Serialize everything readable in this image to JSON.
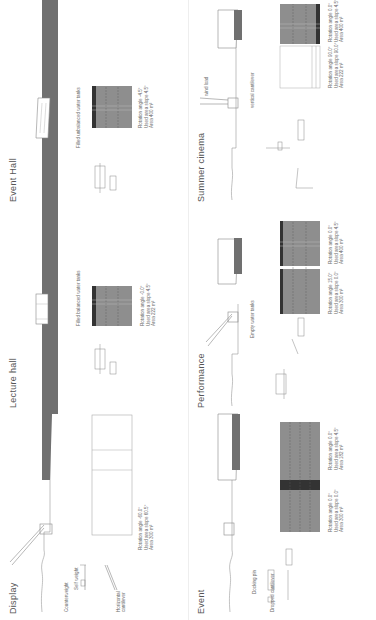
{
  "diagram": {
    "orientation": "rotated 90deg counter-clockwise",
    "colors": {
      "ground_dark": "#707070",
      "grid_fill": "#8e8e8e",
      "line": "#888888",
      "text": "#555555",
      "background": "#ffffff"
    },
    "panels": [
      {
        "title": "Display",
        "labels": [
          "Counterweight",
          "Self weight",
          "Horizontal cantilever"
        ],
        "specs": {
          "rotation": "Rotation angle -60.0°",
          "slope": "Used area slope 60.5°",
          "area": "Area 300 m²"
        }
      },
      {
        "title": "Lecture hall",
        "labels": [
          "Filled balanced water tanks"
        ],
        "specs": {
          "rotation": "Rotation angle -0.0°",
          "slope": "Used area slope 4.5°",
          "area": "Area 222 m²"
        }
      },
      {
        "title": "Event Hall",
        "labels": [
          "Filled unbalanced water tanks"
        ],
        "specs": {
          "rotation": "Rotation angle -4.5°",
          "slope": "Used area slope 4.5°",
          "area": "Area 400 m²"
        }
      },
      {
        "title": "Event",
        "labels": [
          "Docking pin",
          "Dropped cantilever"
        ],
        "specs": [
          {
            "rotation": "Rotation angle 0.0°",
            "slope": "Used area slope 0.0°",
            "area": "Area 300 m²"
          },
          {
            "rotation": "Rotation angle 0.0°",
            "slope": "Used area slope 4.5°",
            "area": "Area 182 m²"
          }
        ]
      },
      {
        "title": "Performance",
        "labels": [
          "Empty water tanks"
        ],
        "specs": [
          {
            "rotation": "Rotation angle 15.0°",
            "slope": "Used area slope 0.0°",
            "area": "Area 300 m²"
          },
          {
            "rotation": "Rotation angle 0.0°",
            "slope": "Used area slope 4.5°",
            "area": "Area 400 m²"
          }
        ]
      },
      {
        "title": "Summer cinema",
        "labels": [
          "wind load",
          "vertical cantilever"
        ],
        "specs": [
          {
            "rotation": "Rotation angle 90.0°",
            "slope": "Used area slope 90.0°",
            "area": "Area 222 m²"
          },
          {
            "rotation": "Rotation angle 0.0°",
            "slope": "Used area slope 4.5°",
            "area": "Area 400 m²"
          }
        ]
      }
    ]
  }
}
